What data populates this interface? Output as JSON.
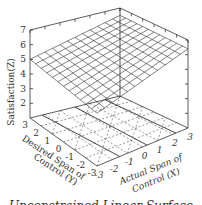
{
  "chart_data": {
    "type": "surface3d",
    "title": "",
    "caption": "Unconstrained Linear Surface",
    "zlabel": "Satisfaction(Z)",
    "ylabel_line1": "Desired Span of",
    "ylabel_line2": "Control (Y)",
    "xlabel_line1": "Actual Span of",
    "xlabel_line2": "Control (X)",
    "z_ticks": [
      "2",
      "3",
      "4",
      "5",
      "6",
      "7"
    ],
    "x_ticks": [
      "-3",
      "-2",
      "-1",
      "0",
      "1",
      "2",
      "3"
    ],
    "y_ticks": [
      "3",
      "2",
      "1",
      "0",
      "-1",
      "-2",
      "-3"
    ],
    "xlim": [
      -3,
      3
    ],
    "ylim": [
      -3,
      3
    ],
    "zlim": [
      1,
      7
    ],
    "surface": {
      "description": "Planar surface Z ~ 5 + 0.25*X",
      "corners": [
        {
          "x": -3,
          "y": 3,
          "z": 5.0
        },
        {
          "x": 3,
          "y": 3,
          "z": 6.5
        },
        {
          "x": 3,
          "y": -3,
          "z": 6.4
        },
        {
          "x": -3,
          "y": -3,
          "z": 4.6
        }
      ],
      "grid_lines": 12
    },
    "floor_projection": "dashed contour/grid projection with solid lines at X = -2, 0, 2"
  }
}
